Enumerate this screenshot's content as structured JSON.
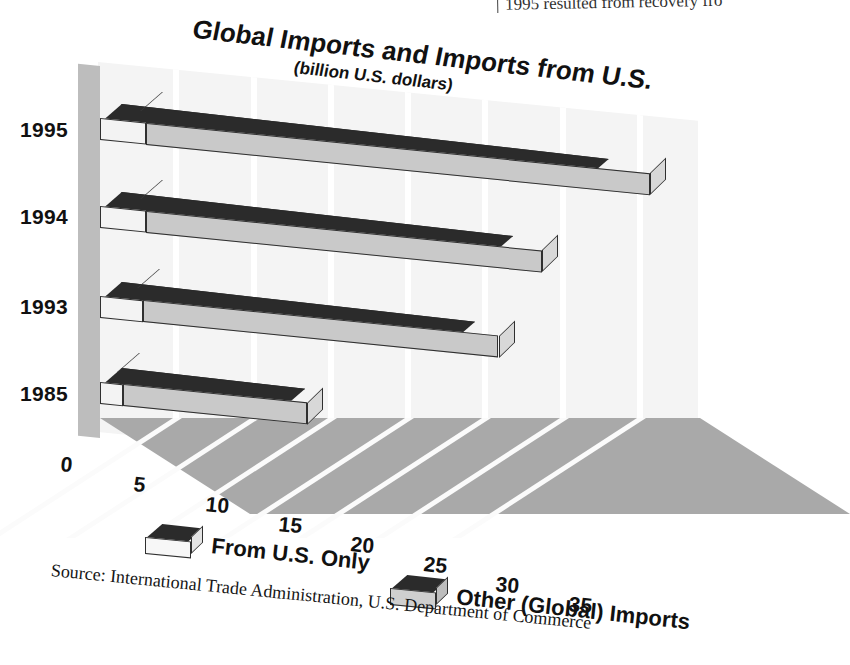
{
  "page": {
    "bleed_text": "1995 resulted from recovery fro"
  },
  "chart_data": {
    "type": "bar",
    "orientation": "horizontal",
    "stacked": true,
    "style": "3d-isometric",
    "title": "Global Imports and Imports from U.S.",
    "subtitle": "(billion U.S. dollars)",
    "xlabel": "",
    "ylabel": "",
    "categories": [
      "1995",
      "1994",
      "1993",
      "1985"
    ],
    "xticks": [
      "0",
      "5",
      "10",
      "15",
      "20",
      "25",
      "30",
      "35"
    ],
    "xlim": [
      0,
      35
    ],
    "grid": true,
    "legend_position": "bottom",
    "series": [
      {
        "name": "From U.S. Only",
        "color": "#f3f3f3",
        "values": [
          3.0,
          3.0,
          2.8,
          1.5
        ]
      },
      {
        "name": "Other (Global) Imports",
        "color": "#2b2b2b",
        "values": [
          32.6,
          25.6,
          23.0,
          11.9
        ]
      }
    ],
    "totals": [
      35.6,
      28.6,
      25.8,
      13.4
    ],
    "source": "Source: International Trade Administration, U.S. Department of Commerce"
  },
  "legend": {
    "items": [
      {
        "label": "From U.S. Only",
        "swatch": "light"
      },
      {
        "label": "Other (Global) Imports",
        "swatch": "gray"
      }
    ]
  },
  "colors": {
    "bar_top": "#2b2b2b",
    "bar_front_other": "#c9c9c9",
    "bar_front_us": "#f3f3f3",
    "floor": "#a9a9a9",
    "back_wall": "#f4f4f4",
    "side_wall": "#bdbdbd",
    "text": "#111111"
  }
}
